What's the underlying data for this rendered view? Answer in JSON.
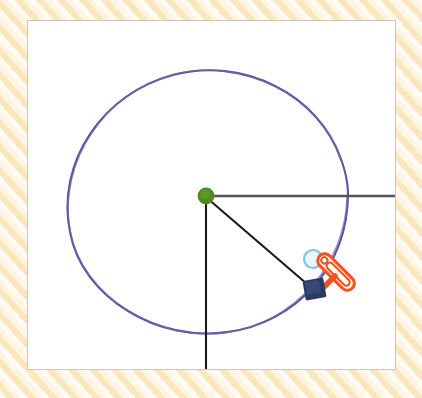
{
  "app": {
    "title": "Geometry Sketch Canvas",
    "background_color": "#fdf0d5",
    "panel_color": "#ffffff",
    "panel_border_color": "#cdc7bb"
  },
  "canvas": {
    "label": "drawing-canvas",
    "x": 27,
    "y": 20,
    "width": 369,
    "height": 350
  },
  "shapes": {
    "circle": {
      "name": "hand-drawn-circle",
      "center_x": 208,
      "center_y": 193,
      "radius": 140,
      "color": "#5a55a3",
      "stroke_width": 2,
      "style": "hand-drawn"
    },
    "center_point": {
      "name": "center-dot",
      "x": 206,
      "y": 196,
      "radius": 8,
      "color": "#4a8a20"
    },
    "radius_line_horizontal": {
      "name": "horizontal-radius-line",
      "x1": 206,
      "y1": 196,
      "x2": 395,
      "y2": 196,
      "color": "#555555",
      "stroke_width": 2
    },
    "radius_line_vertical": {
      "name": "vertical-radius-line",
      "x1": 206,
      "y1": 196,
      "x2": 206,
      "y2": 369,
      "color": "#1a1a1a",
      "stroke_width": 2
    },
    "radius_line_diagonal": {
      "name": "diagonal-radius-line",
      "x1": 206,
      "y1": 196,
      "x2": 313,
      "y2": 289,
      "color": "#1a1a1a",
      "stroke_width": 2
    },
    "drag_handle": {
      "name": "square-drag-handle",
      "x": 305,
      "y": 280,
      "width": 20,
      "height": 19,
      "color": "#2b3a63",
      "rotation_deg": -12
    },
    "hover_circle": {
      "name": "light-blue-hover-circle",
      "center_x": 313,
      "center_y": 259,
      "radius": 9,
      "stroke_color": "#7fc4e8",
      "fill_color": "#eaf6fc",
      "stroke_width": 2
    },
    "pen_tool": {
      "name": "orange-pen-tool",
      "tip_x": 322,
      "tip_y": 288,
      "tail_x": 351,
      "tail_y": 256,
      "color": "#f4511e",
      "stroke_width": 3,
      "length": 44,
      "thickness": 13,
      "rotation_deg": 45
    }
  },
  "colors": {
    "accent_orange": "#f4511e",
    "accent_green": "#4a8a20",
    "accent_navy": "#2b3a63",
    "accent_blue": "#7fc4e8",
    "circle_purple": "#5a55a3"
  }
}
